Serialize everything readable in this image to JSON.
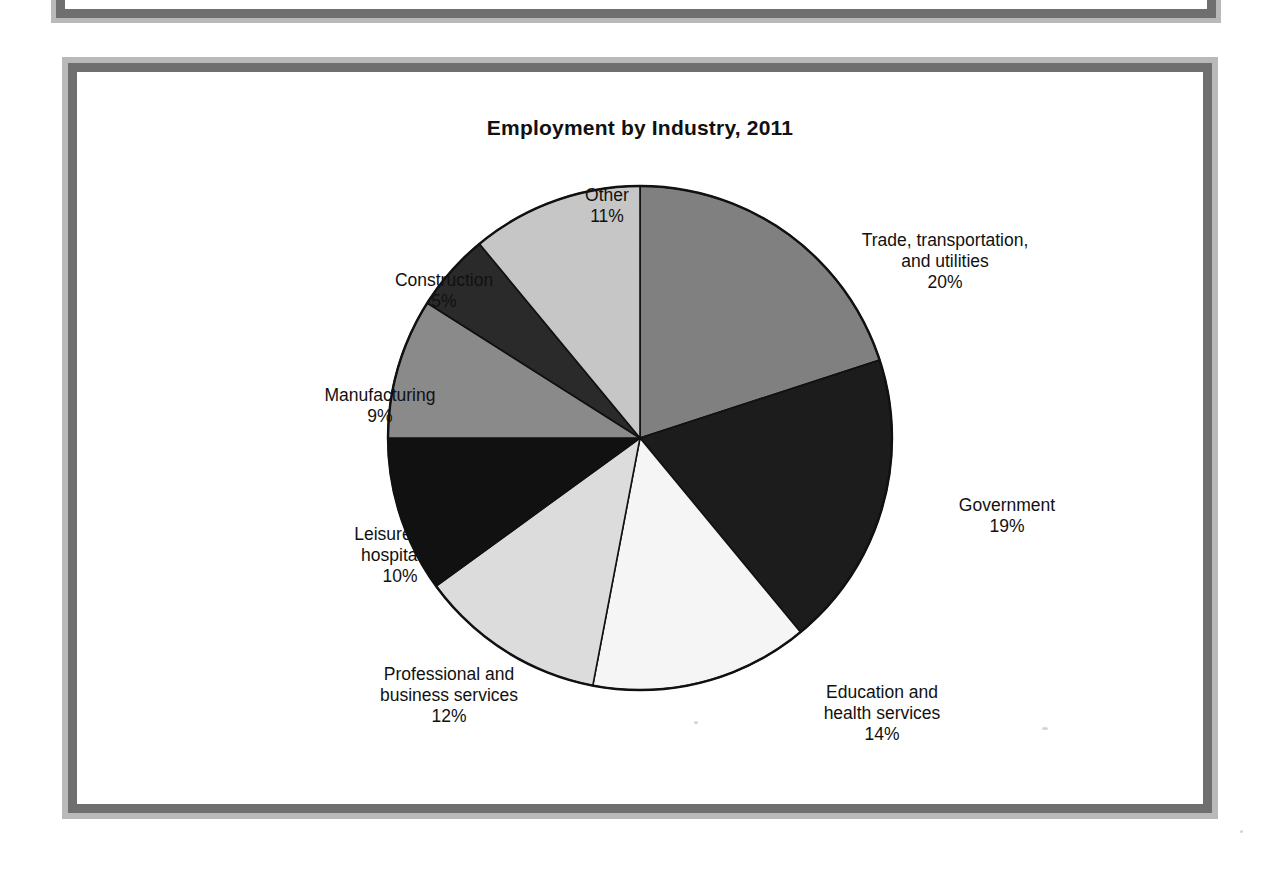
{
  "document": {
    "type": "scanned-page",
    "background_color": "#ffffff",
    "frame_color": "#6f6f6f",
    "frame_shadow_color": "#b9b9b9"
  },
  "chart": {
    "title": "Employment by Industry, 2011"
  },
  "chart_data": {
    "type": "pie",
    "title": "Employment by Industry, 2011",
    "xlabel": "",
    "ylabel": "",
    "units": "percent",
    "start_angle_deg": 0,
    "direction": "clockwise",
    "legend_position": "none-external-labels",
    "grid": false,
    "categories": [
      "Trade, transportation, and utilities",
      "Government",
      "Education and health services",
      "Professional and business services",
      "Leisure and hospitality",
      "Manufacturing",
      "Construction",
      "Other"
    ],
    "values": [
      20,
      19,
      14,
      12,
      10,
      9,
      5,
      11
    ],
    "value_labels": [
      "20%",
      "19%",
      "14%",
      "12%",
      "10%",
      "9%",
      "5%",
      "11%"
    ],
    "colors": [
      "#808080",
      "#1c1c1c",
      "#f5f5f5",
      "#dcdcdc",
      "#111111",
      "#8a8a8a",
      "#2a2a2a",
      "#c6c6c6"
    ],
    "slices": [
      {
        "name": "Trade, transportation, and utilities",
        "label_line1": "Trade, transportation,",
        "label_line2": "and utilities",
        "percent_label": "20%",
        "value": 20,
        "color": "#808080"
      },
      {
        "name": "Government",
        "label_line1": "Government",
        "label_line2": "",
        "percent_label": "19%",
        "value": 19,
        "color": "#1c1c1c"
      },
      {
        "name": "Education and health services",
        "label_line1": "Education and",
        "label_line2": "health services",
        "percent_label": "14%",
        "value": 14,
        "color": "#f5f5f5"
      },
      {
        "name": "Professional and business services",
        "label_line1": "Professional and",
        "label_line2": "business services",
        "percent_label": "12%",
        "value": 12,
        "color": "#dcdcdc"
      },
      {
        "name": "Leisure and hospitality",
        "label_line1": "Leisure and",
        "label_line2": "hospitality",
        "percent_label": "10%",
        "value": 10,
        "color": "#111111"
      },
      {
        "name": "Manufacturing",
        "label_line1": "Manufacturing",
        "label_line2": "",
        "percent_label": "9%",
        "value": 9,
        "color": "#8a8a8a"
      },
      {
        "name": "Construction",
        "label_line1": "Construction",
        "label_line2": "",
        "percent_label": "5%",
        "value": 5,
        "color": "#2a2a2a"
      },
      {
        "name": "Other",
        "label_line1": "Other",
        "label_line2": "",
        "percent_label": "11%",
        "value": 11,
        "color": "#c6c6c6"
      }
    ]
  },
  "labels": {
    "trade": "Trade, transportation,\nand utilities\n20%",
    "government": "Government\n19%",
    "education": "Education and\nhealth services\n14%",
    "professional": "Professional and\nbusiness services\n12%",
    "leisure": "Leisure and\nhospitality\n10%",
    "manufacturing": "Manufacturing\n9%",
    "construction": "Construction\n5%",
    "other": "Other\n11%"
  }
}
